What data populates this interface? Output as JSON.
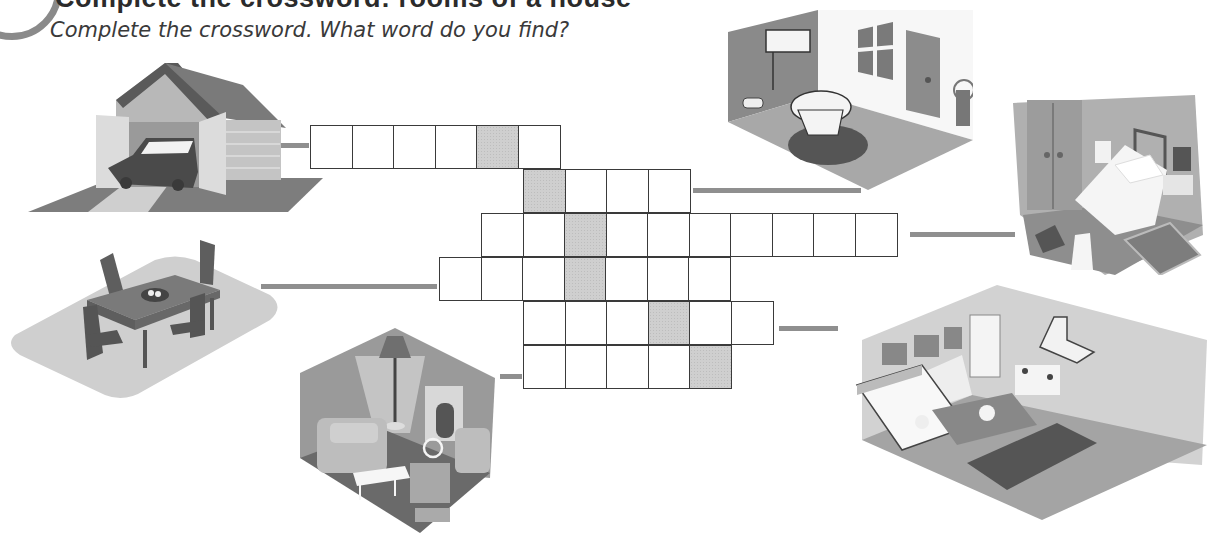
{
  "exercise": {
    "heading": "Complete the crossword: rooms of a house",
    "instruction": "Complete the crossword. What word do you find?"
  },
  "crossword": {
    "cell_size": 43,
    "rows": [
      {
        "id": 1,
        "room": "garage",
        "left": 310,
        "top": 125,
        "length": 6,
        "shaded_index": 4
      },
      {
        "id": 2,
        "room": "bathroom",
        "left": 523,
        "top": 169,
        "length": 4,
        "shaded_index": 0
      },
      {
        "id": 3,
        "room": "bedroom",
        "left": 481,
        "top": 213,
        "length": 10,
        "shaded_index": 2
      },
      {
        "id": 4,
        "room": "dining room",
        "left": 439,
        "top": 257,
        "length": 7,
        "shaded_index": 3
      },
      {
        "id": 5,
        "room": "kitchen",
        "left": 523,
        "top": 301,
        "length": 6,
        "shaded_index": 3
      },
      {
        "id": 6,
        "room": "living room",
        "left": 523,
        "top": 345,
        "length": 5,
        "shaded_index": 4
      }
    ],
    "shaded_color": "#cfcfcf",
    "border_color": "#3a3a3a"
  },
  "illustrations": [
    {
      "name": "garage",
      "caption": "Garage with car"
    },
    {
      "name": "bathroom",
      "caption": "Bathroom with toilet"
    },
    {
      "name": "bedroom",
      "caption": "Bedroom with bed"
    },
    {
      "name": "dining-room",
      "caption": "Dining table with chairs"
    },
    {
      "name": "living-room",
      "caption": "Living room with sofa and fireplace"
    },
    {
      "name": "kitchen",
      "caption": "Kitchen with sink and stove"
    }
  ],
  "connectors": [
    {
      "room": "garage",
      "left": 278,
      "top": 143,
      "width": 31
    },
    {
      "room": "bathroom",
      "left": 693,
      "top": 188,
      "width": 168
    },
    {
      "room": "bedroom",
      "left": 910,
      "top": 232,
      "width": 105
    },
    {
      "room": "dining-room",
      "left": 261,
      "top": 284,
      "width": 176
    },
    {
      "room": "kitchen",
      "left": 779,
      "top": 326,
      "width": 59
    },
    {
      "room": "living-room",
      "left": 500,
      "top": 374,
      "width": 22
    }
  ]
}
